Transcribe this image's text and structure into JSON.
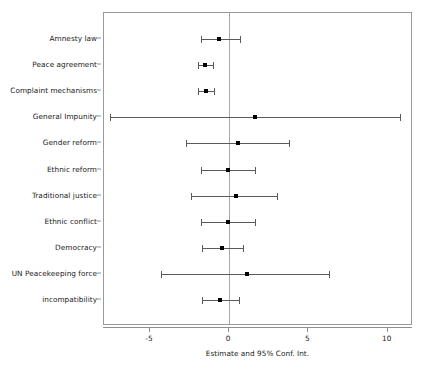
{
  "chart_data": {
    "type": "scatter",
    "subtype": "forest-plot",
    "title": "",
    "xlabel": "Estimate and 95% Conf. Int.",
    "ylabel": "",
    "xlim": [
      -7.9,
      11.6
    ],
    "xticks": [
      -5,
      0,
      5,
      10
    ],
    "xticklabels": [
      "-5",
      "0",
      "5",
      "10"
    ],
    "grid": false,
    "legend": null,
    "reference_line": 0,
    "categories": [
      "Amnesty law",
      "Peace agreement",
      "Complaint mechanisms",
      "General Impunity",
      "Gender reform",
      "Ethnic reform",
      "Traditional justice",
      "Ethnic conflict",
      "Democracy",
      "UN Peacekeeping force",
      "incompatibility"
    ],
    "points": [
      {
        "label": "Amnesty law",
        "estimate": -0.65,
        "lower": -1.8,
        "upper": 0.7
      },
      {
        "label": "Peace agreement",
        "estimate": -1.5,
        "lower": -1.95,
        "upper": -1.0
      },
      {
        "label": "Complaint mechanisms",
        "estimate": -1.45,
        "lower": -1.95,
        "upper": -0.95
      },
      {
        "label": "General Impunity",
        "estimate": 1.6,
        "lower": -7.5,
        "upper": 10.8
      },
      {
        "label": "Gender reform",
        "estimate": 0.55,
        "lower": -2.7,
        "upper": 3.8
      },
      {
        "label": "Ethnic reform",
        "estimate": -0.05,
        "lower": -1.8,
        "upper": 1.6
      },
      {
        "label": "Traditional justice",
        "estimate": 0.4,
        "lower": -2.4,
        "upper": 3.0
      },
      {
        "label": "Ethnic conflict",
        "estimate": -0.1,
        "lower": -1.8,
        "upper": 1.6
      },
      {
        "label": "Democracy",
        "estimate": -0.45,
        "lower": -1.7,
        "upper": 0.85
      },
      {
        "label": "UN Peacekeeping force",
        "estimate": 1.1,
        "lower": -4.3,
        "upper": 6.3
      },
      {
        "label": "incompatibility",
        "estimate": -0.6,
        "lower": -1.7,
        "upper": 0.65
      }
    ]
  },
  "colors": {
    "point": "#000000",
    "interval": "#5a5a5a",
    "axis": "#8f8f8f",
    "zero_line": "#a8a8a8",
    "text": "#1a1a1a",
    "background": "#ffffff"
  }
}
